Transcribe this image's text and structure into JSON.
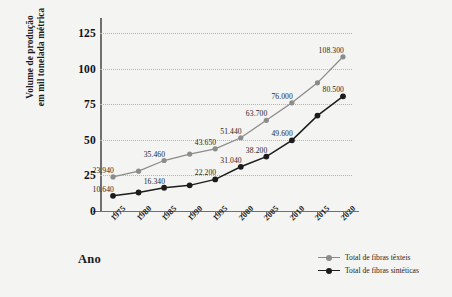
{
  "chart_data": {
    "type": "line",
    "title": "",
    "xlabel": "Ano",
    "ylabel": "Volume de produção em mil tonelada métrica",
    "ylabel_line1": "Volume de produção",
    "ylabel_line2": "em mil tonelada métrica",
    "categories": [
      "1975",
      "1980",
      "1985",
      "1990",
      "1995",
      "2000",
      "2005",
      "2010",
      "2015",
      "2020"
    ],
    "ylim": [
      0,
      135
    ],
    "yticks": [
      "0",
      "25",
      "50",
      "75",
      "100",
      "125"
    ],
    "ytick_values": [
      0,
      25,
      50,
      75,
      100,
      125
    ],
    "grid": "horizontal-dotted",
    "legend_position": "bottom-right",
    "series": [
      {
        "name": "Total de fibras têxteis",
        "color": "#8c8c8c",
        "marker": "circle",
        "values": [
          23.94,
          28.0,
          35.46,
          40.0,
          43.65,
          51.44,
          63.7,
          76.0,
          90.0,
          108.3
        ],
        "point_labels": [
          "23.940",
          "",
          "35.460",
          "",
          "43.650",
          "51.440",
          "63.700",
          "76.000",
          "",
          "108.300"
        ]
      },
      {
        "name": "Total de fibras sintéticas",
        "color": "#1c1c1c",
        "marker": "circle",
        "values": [
          10.64,
          13.0,
          16.34,
          18.0,
          22.2,
          31.04,
          38.2,
          49.6,
          67.0,
          80.5
        ],
        "point_labels": [
          "10.640",
          "",
          "16.340",
          "",
          "22.200",
          "31.040",
          "38.200",
          "49.600",
          "",
          "80.500"
        ]
      }
    ]
  },
  "legend": {
    "items": [
      {
        "label": "Total de fibras têxteis",
        "color": "#8c8c8c"
      },
      {
        "label": "Total de fibras sintéticas",
        "color": "#1c1c1c"
      }
    ]
  }
}
